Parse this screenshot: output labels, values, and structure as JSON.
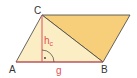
{
  "diagram": {
    "vertices": {
      "A": {
        "label": "A",
        "x": 16,
        "y": 62
      },
      "B": {
        "label": "B",
        "x": 103,
        "y": 62
      },
      "C": {
        "label": "C",
        "x": 42,
        "y": 15
      },
      "D": {
        "x": 130,
        "y": 15
      }
    },
    "labels": {
      "a": "A",
      "b": "B",
      "c": "C",
      "height": "h",
      "height_sub": "c",
      "base": "g"
    },
    "colors": {
      "triangle_fill": "#fbeec4",
      "second_triangle_fill": "#f7cf7a",
      "outline": "#404040",
      "accent_red": "#e0505a",
      "label_dark": "#333333"
    }
  }
}
